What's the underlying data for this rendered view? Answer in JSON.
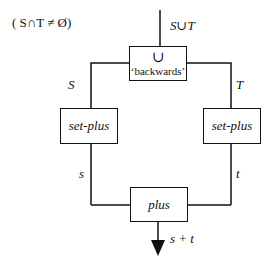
{
  "condition": "( S∩T ≠ Ø)",
  "top_input_label": "S∪T",
  "union_box": {
    "symbol": "∪",
    "caption": "‘backwards’"
  },
  "left_branch": {
    "input_label": "S",
    "box_label": "set-plus",
    "output_label": "s"
  },
  "right_branch": {
    "input_label": "T",
    "box_label": "set-plus",
    "output_label": "t"
  },
  "plus_box": {
    "label": "plus"
  },
  "output_label": "s + t",
  "colors": {
    "stroke": "#111111",
    "background": "#ffffff"
  }
}
